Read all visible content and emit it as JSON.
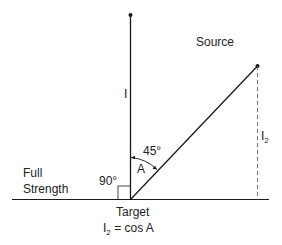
{
  "labels": {
    "source": "Source",
    "intensity": "I",
    "i2_main": "I",
    "i2_sub": "2",
    "angle_value": "45°",
    "angle_name": "A",
    "right_angle": "90°",
    "full_line1": "Full",
    "full_line2": "Strength",
    "target": "Target",
    "formula_i": "I",
    "formula_sub": "2",
    "formula_rest": " = cos A"
  },
  "colors": {
    "line": "#1a1a1a",
    "background": "#ffffff"
  }
}
